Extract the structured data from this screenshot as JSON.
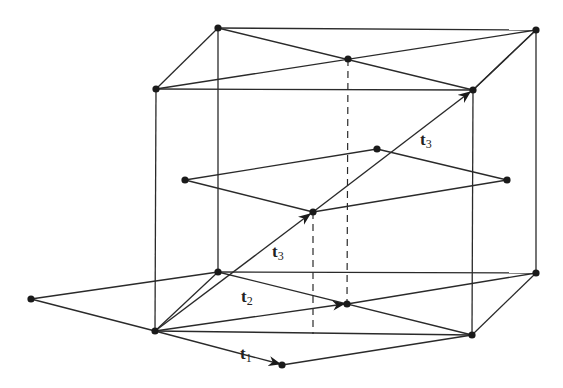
{
  "diagram": {
    "labels": [
      {
        "id": "t1",
        "base": "t",
        "sub": "1",
        "x": 240,
        "y": 355
      },
      {
        "id": "t2",
        "base": "t",
        "sub": "2",
        "x": 241,
        "y": 294
      },
      {
        "id": "t3_lower",
        "base": "t",
        "sub": "3",
        "x": 272,
        "y": 249
      },
      {
        "id": "t3_upper",
        "base": "t",
        "sub": "3",
        "x": 420,
        "y": 137
      }
    ],
    "points": {
      "TBL": [
        218,
        28
      ],
      "TBR": [
        536,
        30
      ],
      "TM": [
        348,
        59
      ],
      "TFL": [
        156,
        89
      ],
      "TFR": [
        473,
        90
      ],
      "ML": [
        185,
        180
      ],
      "MT": [
        377,
        149
      ],
      "MR": [
        507,
        180
      ],
      "MC": [
        313,
        212
      ],
      "BBL": [
        218,
        272
      ],
      "BBR": [
        536,
        273
      ],
      "BFL": [
        155,
        331
      ],
      "BFR": [
        472,
        335
      ],
      "BOL": [
        31,
        299
      ],
      "BM": [
        347,
        304
      ],
      "BT1": [
        282,
        365
      ]
    },
    "colors": {
      "line": "#2a2a2a",
      "node": "#1a1a1a",
      "background": "#ffffff"
    }
  }
}
